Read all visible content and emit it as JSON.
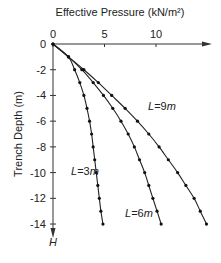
{
  "chart_data": {
    "type": "line",
    "title": "",
    "xlabel": "Effective Pressure (kN/m²)",
    "ylabel": "Trench Depth (m)",
    "y_axis_end_label": "H",
    "xlim": [
      0,
      15
    ],
    "ylim": [
      -14,
      0
    ],
    "x_ticks": [
      0,
      5,
      10
    ],
    "y_ticks": [
      0,
      -2,
      -4,
      -6,
      -8,
      -10,
      -12,
      -14
    ],
    "grid": false,
    "legend": "inline labels",
    "series": [
      {
        "name": "L=3m",
        "label": "L=3m",
        "x": [
          0,
          1.5,
          2.1,
          2.6,
          3.0,
          3.3,
          3.55,
          3.75,
          3.9,
          4.05,
          4.2,
          4.35,
          4.5,
          4.65,
          4.85
        ],
        "y": [
          0,
          -1,
          -2,
          -3,
          -4,
          -5,
          -6,
          -7,
          -8,
          -9,
          -10,
          -11,
          -12,
          -13,
          -14
        ]
      },
      {
        "name": "L=6m",
        "label": "L=6m",
        "x": [
          0,
          1.5,
          2.8,
          3.9,
          4.9,
          5.8,
          6.6,
          7.3,
          7.9,
          8.4,
          8.9,
          9.3,
          9.7,
          10.1,
          10.5
        ],
        "y": [
          0,
          -1,
          -2,
          -3,
          -4,
          -5,
          -6,
          -7,
          -8,
          -9,
          -10,
          -11,
          -12,
          -13,
          -14
        ]
      },
      {
        "name": "L=9m",
        "label": "L=9m",
        "x": [
          0,
          1.5,
          3.0,
          4.4,
          5.7,
          7.0,
          8.2,
          9.3,
          10.3,
          11.2,
          12.1,
          12.9,
          13.7,
          14.3,
          14.9
        ],
        "y": [
          0,
          -1,
          -2,
          -3,
          -4,
          -5,
          -6,
          -7,
          -8,
          -9,
          -10,
          -11,
          -12,
          -13,
          -14
        ]
      }
    ]
  }
}
